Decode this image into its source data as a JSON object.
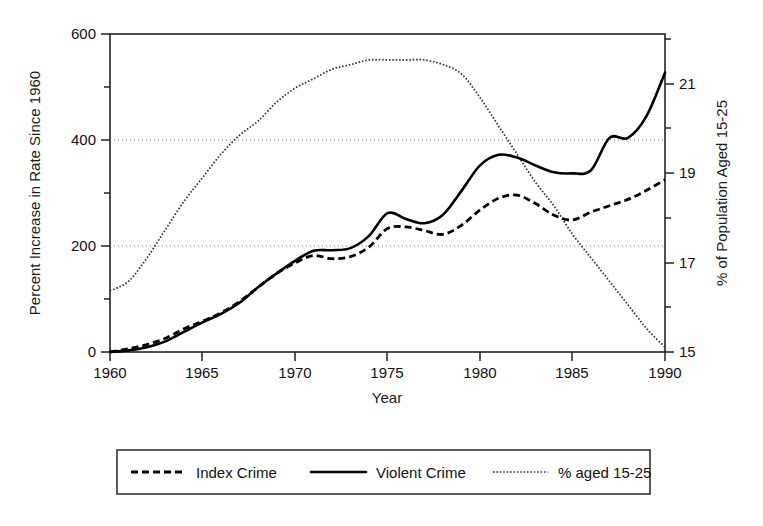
{
  "chart_data": {
    "type": "line",
    "title": "",
    "xlabel": "Year",
    "ylabel": "Percent Increase in Rate Since 1960",
    "y2label": "% of Population Aged 15-25",
    "xlim": [
      1960,
      1990
    ],
    "ylim": [
      0,
      600
    ],
    "y2lim": [
      15,
      21.75
    ],
    "xticks": [
      1960,
      1965,
      1970,
      1975,
      1980,
      1985,
      1990
    ],
    "xtick_labels": [
      "1960",
      "1965",
      "1970",
      "1975",
      "1980",
      "1985",
      "1990"
    ],
    "yticks": [
      0,
      200,
      400,
      600
    ],
    "ytick_labels": [
      "0",
      "200",
      "400",
      "600"
    ],
    "yticks_minor": [
      100,
      300,
      500
    ],
    "y2ticks": [
      15,
      17,
      19,
      21
    ],
    "y2tick_labels": [
      "15",
      "17",
      "19",
      "21"
    ],
    "y2ticks_minor": [
      16,
      18,
      20
    ],
    "gridlines_y": [
      200,
      400
    ],
    "grid": true,
    "legend_position": "below-outside",
    "x": [
      1960,
      1961,
      1962,
      1963,
      1964,
      1965,
      1966,
      1967,
      1968,
      1969,
      1970,
      1971,
      1972,
      1973,
      1974,
      1975,
      1976,
      1977,
      1978,
      1979,
      1980,
      1981,
      1982,
      1983,
      1984,
      1985,
      1986,
      1987,
      1988,
      1989,
      1990
    ],
    "series": [
      {
        "name": "Index Crime",
        "axis": "left",
        "style": "dashed",
        "values": [
          0,
          6,
          14,
          26,
          44,
          58,
          74,
          95,
          122,
          148,
          168,
          182,
          176,
          180,
          198,
          233,
          236,
          229,
          222,
          239,
          268,
          290,
          296,
          280,
          258,
          249,
          264,
          276,
          288,
          305,
          325
        ]
      },
      {
        "name": "Violent Crime",
        "axis": "left",
        "style": "solid",
        "values": [
          0,
          3,
          9,
          20,
          38,
          56,
          72,
          93,
          122,
          148,
          172,
          191,
          192,
          196,
          219,
          262,
          251,
          243,
          259,
          304,
          352,
          372,
          367,
          352,
          339,
          337,
          343,
          404,
          404,
          445,
          527
        ]
      },
      {
        "name": "% aged 15-25",
        "axis": "right",
        "style": "dotted",
        "values": [
          16.3,
          16.5,
          17.0,
          17.6,
          18.2,
          18.7,
          19.2,
          19.6,
          19.9,
          20.3,
          20.6,
          20.8,
          21.0,
          21.1,
          21.2,
          21.2,
          21.2,
          21.2,
          21.1,
          20.9,
          20.4,
          19.8,
          19.2,
          18.6,
          18.1,
          17.5,
          17.0,
          16.5,
          16.0,
          15.5,
          15.1
        ]
      }
    ],
    "legend": [
      {
        "label": "Index Crime",
        "style": "dashed"
      },
      {
        "label": "Violent Crime",
        "style": "solid"
      },
      {
        "label": "% aged 15-25",
        "style": "dotted"
      }
    ]
  }
}
